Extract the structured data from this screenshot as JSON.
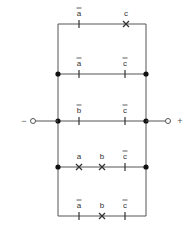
{
  "diagram": {
    "type": "switching-circuit",
    "left_rail_x": 58,
    "right_rail_x": 146,
    "terminals": {
      "negative": {
        "sign": "−",
        "x": 33,
        "sign_x": 24
      },
      "positive": {
        "sign": "+",
        "x": 168,
        "sign_x": 180
      }
    },
    "input_row_y": 121,
    "branches": [
      {
        "id": "row1",
        "y": 24,
        "junctions": false,
        "contacts": [
          {
            "var": "a",
            "negated": true,
            "x": 79,
            "symbol": "break"
          },
          {
            "var": "c",
            "negated": false,
            "x": 126,
            "symbol": "make"
          }
        ]
      },
      {
        "id": "row2",
        "y": 74,
        "junctions": true,
        "contacts": [
          {
            "var": "a",
            "negated": true,
            "x": 79,
            "symbol": "break"
          },
          {
            "var": "c",
            "negated": true,
            "x": 125,
            "symbol": "break"
          }
        ]
      },
      {
        "id": "row3",
        "y": 121,
        "junctions": true,
        "contacts": [
          {
            "var": "b",
            "negated": true,
            "x": 79,
            "symbol": "break"
          },
          {
            "var": "c",
            "negated": true,
            "x": 125,
            "symbol": "break"
          }
        ]
      },
      {
        "id": "row4",
        "y": 167,
        "junctions": true,
        "contacts": [
          {
            "var": "a",
            "negated": false,
            "x": 79,
            "symbol": "make"
          },
          {
            "var": "b",
            "negated": false,
            "x": 102,
            "symbol": "make"
          },
          {
            "var": "c",
            "negated": true,
            "x": 125,
            "symbol": "break"
          }
        ]
      },
      {
        "id": "row5",
        "y": 216,
        "junctions": false,
        "contacts": [
          {
            "var": "a",
            "negated": true,
            "x": 79,
            "symbol": "break"
          },
          {
            "var": "b",
            "negated": false,
            "x": 102,
            "symbol": "make"
          },
          {
            "var": "c",
            "negated": true,
            "x": 125,
            "symbol": "break"
          }
        ]
      }
    ],
    "colors": {
      "wire": "#555555",
      "text": "#333333",
      "background": "#ffffff"
    }
  }
}
